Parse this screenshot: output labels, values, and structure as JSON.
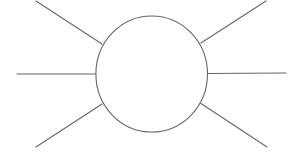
{
  "diagram": {
    "type": "spider-diagram",
    "background": "#ffffff",
    "stroke_color": "#666666",
    "stroke_width": 1.1,
    "center_node": {
      "shape": "ellipse",
      "cx": 151.7,
      "cy": 74,
      "rx": 55.8,
      "ry": 58,
      "fill": "#ffffff",
      "label": ""
    },
    "branches": [
      {
        "id": "top-left",
        "x1": 102,
        "y1": 44,
        "x2": 36,
        "y2": 1,
        "label": ""
      },
      {
        "id": "middle-left",
        "x1": 96,
        "y1": 74,
        "x2": 17,
        "y2": 74,
        "label": ""
      },
      {
        "id": "bottom-left",
        "x1": 102,
        "y1": 104,
        "x2": 36,
        "y2": 147,
        "label": ""
      },
      {
        "id": "top-right",
        "x1": 201,
        "y1": 43,
        "x2": 266,
        "y2": 1,
        "label": ""
      },
      {
        "id": "middle-right",
        "x1": 207,
        "y1": 73.5,
        "x2": 286,
        "y2": 73,
        "label": ""
      },
      {
        "id": "bottom-right",
        "x1": 201,
        "y1": 103.5,
        "x2": 267,
        "y2": 147,
        "label": ""
      }
    ]
  }
}
